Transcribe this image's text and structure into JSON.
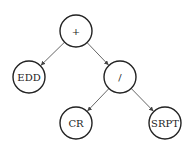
{
  "diagram": {
    "type": "expression-tree",
    "nodes": [
      {
        "id": "plus",
        "label": "+",
        "cx": 76,
        "cy": 31,
        "r": 16
      },
      {
        "id": "edd",
        "label": "EDD",
        "cx": 29,
        "cy": 77,
        "r": 16
      },
      {
        "id": "div",
        "label": "/",
        "cx": 120,
        "cy": 77,
        "r": 16
      },
      {
        "id": "cr",
        "label": "CR",
        "cx": 76,
        "cy": 123,
        "r": 16
      },
      {
        "id": "srpt",
        "label": "SRPT",
        "cx": 165,
        "cy": 123,
        "r": 16
      }
    ],
    "edges": [
      {
        "from": "plus",
        "to": "edd"
      },
      {
        "from": "plus",
        "to": "div"
      },
      {
        "from": "div",
        "to": "cr"
      },
      {
        "from": "div",
        "to": "srpt"
      }
    ],
    "colors": {
      "node_stroke": "#222222",
      "edge": "#555555",
      "background": "#ffffff"
    }
  }
}
